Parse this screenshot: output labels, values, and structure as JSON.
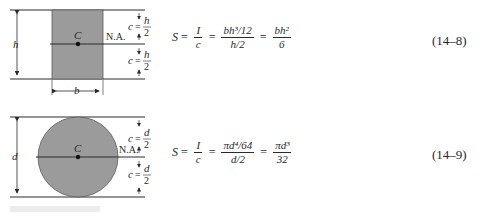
{
  "figures": [
    {
      "shape": "rectangle",
      "labels": {
        "height": "h",
        "width": "b",
        "centroid": "C",
        "neutral_axis": "N.A.",
        "c_var": "c",
        "c_num": "h",
        "c_den": "2"
      },
      "equation": {
        "lhs": "S",
        "f1_num": "I",
        "f1_den": "c",
        "f2_num": "bh³/12",
        "f2_den": "h/2",
        "f3_num": "bh²",
        "f3_den": "6"
      },
      "equation_number": "(14–8)"
    },
    {
      "shape": "circle",
      "labels": {
        "diameter": "d",
        "centroid": "C",
        "neutral_axis": "N.A.",
        "c_var": "c",
        "c_num": "d",
        "c_den": "2"
      },
      "equation": {
        "lhs": "S",
        "f1_num": "I",
        "f1_den": "c",
        "f2_num": "πd⁴/64",
        "f2_den": "d/2",
        "f3_num": "πd³",
        "f3_den": "32"
      },
      "equation_number": "(14–9)"
    }
  ],
  "colors": {
    "fill": "#9b9b9b",
    "line": "#2a2a2a"
  }
}
